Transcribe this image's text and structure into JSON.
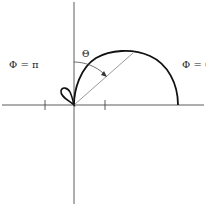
{
  "diagram": {
    "type": "polar radiation pattern",
    "labels": {
      "phi_pi": "Φ = π",
      "phi_zero": "Φ = 0",
      "theta": "Θ"
    },
    "colors": {
      "curve": "#111111",
      "axes": "#333333",
      "radius_line": "#555555"
    }
  }
}
